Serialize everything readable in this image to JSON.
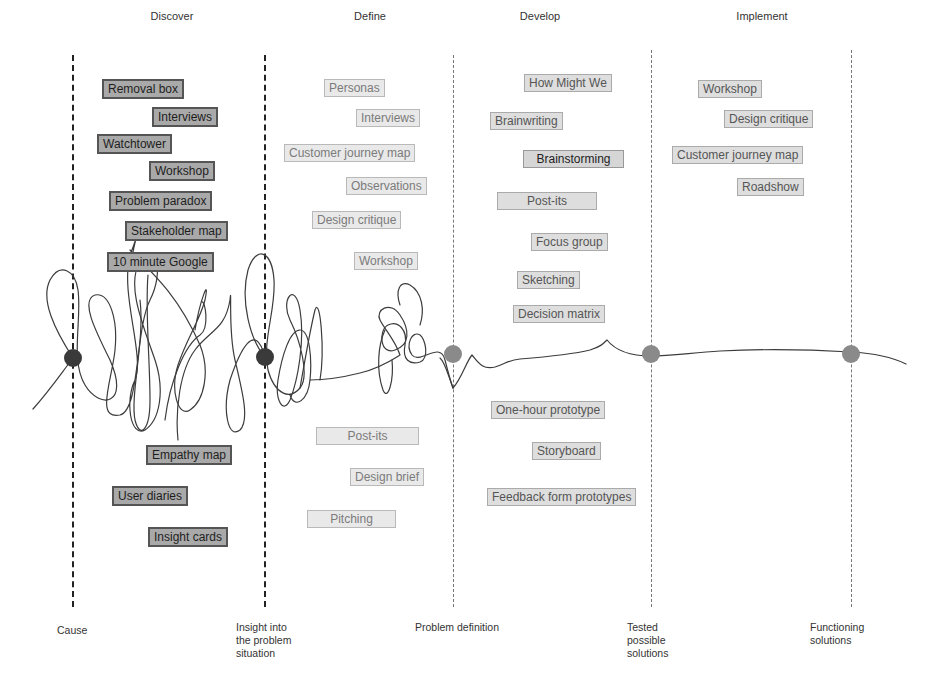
{
  "phases": [
    {
      "label": "Discover",
      "x": 172
    },
    {
      "label": "Define",
      "x": 370
    },
    {
      "label": "Develop",
      "x": 540
    },
    {
      "label": "Implement",
      "x": 762
    }
  ],
  "divider_lines": [
    {
      "x": 73,
      "style": "dark",
      "top": 55,
      "bottom": 607
    },
    {
      "x": 265,
      "style": "dark",
      "top": 55,
      "bottom": 607
    },
    {
      "x": 453,
      "style": "light",
      "top": 55,
      "bottom": 607
    },
    {
      "x": 651,
      "style": "light",
      "top": 50,
      "bottom": 607
    },
    {
      "x": 851,
      "style": "light",
      "top": 50,
      "bottom": 607
    }
  ],
  "milestone_dots": [
    {
      "x": 73,
      "y": 358,
      "color": "#3a3a3a"
    },
    {
      "x": 265,
      "y": 357,
      "color": "#3a3a3a"
    },
    {
      "x": 453,
      "y": 354,
      "color": "#8a8a8a"
    },
    {
      "x": 651,
      "y": 354,
      "color": "#8a8a8a"
    },
    {
      "x": 851,
      "y": 354,
      "color": "#8a8a8a"
    }
  ],
  "milestones": [
    {
      "label": "Cause",
      "x": 57,
      "y": 624
    },
    {
      "label": "Insight into\nthe problem\nsituation",
      "x": 236,
      "y": 621
    },
    {
      "label": "Problem definition",
      "x": 415,
      "y": 621
    },
    {
      "label": "Tested\npossible\nsolutions",
      "x": 627,
      "y": 621
    },
    {
      "label": "Functioning\nsolutions",
      "x": 810,
      "y": 621
    }
  ],
  "methods": {
    "discover": [
      {
        "label": "Removal box",
        "x": 102,
        "y": 79,
        "style": "dark"
      },
      {
        "label": "Interviews",
        "x": 152,
        "y": 107,
        "style": "dark"
      },
      {
        "label": "Watchtower",
        "x": 97,
        "y": 134,
        "style": "dark"
      },
      {
        "label": "Workshop",
        "x": 149,
        "y": 161,
        "style": "dark"
      },
      {
        "label": "Problem paradox",
        "x": 109,
        "y": 191,
        "style": "dark"
      },
      {
        "label": "Stakeholder map",
        "x": 125,
        "y": 221,
        "style": "dark"
      },
      {
        "label": "10 minute Google",
        "x": 107,
        "y": 252,
        "style": "dark"
      },
      {
        "label": "Empathy map",
        "x": 146,
        "y": 445,
        "style": "dark"
      },
      {
        "label": "User diaries",
        "x": 112,
        "y": 486,
        "style": "dark"
      },
      {
        "label": "Insight cards",
        "x": 148,
        "y": 527,
        "style": "dark"
      }
    ],
    "define": [
      {
        "label": "Personas",
        "x": 324,
        "y": 79,
        "style": "light"
      },
      {
        "label": "Interviews",
        "x": 356,
        "y": 109,
        "style": "light"
      },
      {
        "label": "Customer journey map",
        "x": 284,
        "y": 144,
        "style": "light"
      },
      {
        "label": "Observations",
        "x": 346,
        "y": 177,
        "style": "light"
      },
      {
        "label": "Design critique",
        "x": 312,
        "y": 211,
        "style": "light"
      },
      {
        "label": "Workshop",
        "x": 354,
        "y": 252,
        "style": "light"
      },
      {
        "label": "Post-its",
        "x": 316,
        "y": 427,
        "style": "light"
      },
      {
        "label": "Design brief",
        "x": 350,
        "y": 468,
        "style": "light"
      },
      {
        "label": "Pitching",
        "x": 307,
        "y": 510,
        "style": "light"
      }
    ],
    "develop": [
      {
        "label": "How Might We",
        "x": 524,
        "y": 74,
        "style": "mid"
      },
      {
        "label": "Brainwriting",
        "x": 490,
        "y": 112,
        "style": "mid"
      },
      {
        "label": "Brainstorming",
        "x": 523,
        "y": 150,
        "style": "strong"
      },
      {
        "label": "Post-its",
        "x": 497,
        "y": 192,
        "style": "mid"
      },
      {
        "label": "Focus group",
        "x": 531,
        "y": 233,
        "style": "mid"
      },
      {
        "label": "Sketching",
        "x": 517,
        "y": 271,
        "style": "mid"
      },
      {
        "label": "Decision matrix",
        "x": 513,
        "y": 305,
        "style": "mid"
      },
      {
        "label": "One-hour prototype",
        "x": 491,
        "y": 401,
        "style": "mid"
      },
      {
        "label": "Storyboard",
        "x": 532,
        "y": 442,
        "style": "mid"
      },
      {
        "label": "Feedback form prototypes",
        "x": 487,
        "y": 488,
        "style": "mid"
      }
    ],
    "implement": [
      {
        "label": "Workshop",
        "x": 698,
        "y": 80,
        "style": "mid"
      },
      {
        "label": "Design critique",
        "x": 724,
        "y": 110,
        "style": "mid"
      },
      {
        "label": "Customer journey map",
        "x": 672,
        "y": 146,
        "style": "mid"
      },
      {
        "label": "Roadshow",
        "x": 737,
        "y": 178,
        "style": "mid"
      }
    ]
  }
}
